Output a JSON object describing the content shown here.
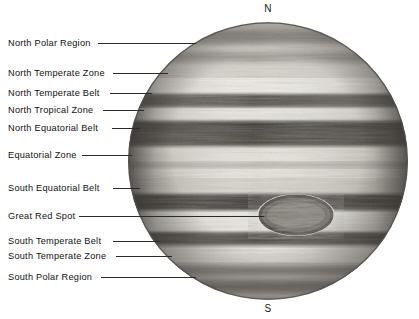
{
  "figure": {
    "background_color": "#ffffff",
    "line_color": "#2b2b2b",
    "text_color": "#111111"
  },
  "poles": {
    "north": "N",
    "south": "S"
  },
  "disc": {
    "center_x": 268,
    "center_y": 161,
    "radius": 140,
    "left": 128,
    "top": 22,
    "width": 280,
    "height": 278
  },
  "labels": [
    {
      "id": "north-polar-region",
      "text": "North Polar Region",
      "text_x": 8,
      "text_y": 38,
      "line_y": 43,
      "line_x1": 98,
      "line_x2": 196
    },
    {
      "id": "north-temperate-zone",
      "text": "North Temperate Zone",
      "text_x": 8,
      "text_y": 68,
      "line_y": 73,
      "line_x1": 113,
      "line_x2": 168
    },
    {
      "id": "north-temperate-belt",
      "text": "North Temperate Belt",
      "text_x": 8,
      "text_y": 88,
      "line_y": 93,
      "line_x1": 110,
      "line_x2": 152
    },
    {
      "id": "north-tropical-zone",
      "text": "North Tropical Zone",
      "text_x": 8,
      "text_y": 105,
      "line_y": 110,
      "line_x1": 103,
      "line_x2": 144
    },
    {
      "id": "north-equatorial-belt",
      "text": "North Equatorial Belt",
      "text_x": 8,
      "text_y": 123,
      "line_y": 128,
      "line_x1": 112,
      "line_x2": 140
    },
    {
      "id": "equatorial-zone",
      "text": "Equatorial Zone",
      "text_x": 8,
      "text_y": 150,
      "line_y": 155,
      "line_x1": 82,
      "line_x2": 132
    },
    {
      "id": "south-equatorial-belt",
      "text": "South Equatorial Belt",
      "text_x": 8,
      "text_y": 183,
      "line_y": 188,
      "line_x1": 113,
      "line_x2": 140
    },
    {
      "id": "great-red-spot",
      "text": "Great Red Spot",
      "text_x": 8,
      "text_y": 211,
      "line_y": 216,
      "line_x1": 79,
      "line_x2": 264
    },
    {
      "id": "south-temperate-belt",
      "text": "South Temperate Belt",
      "text_x": 8,
      "text_y": 236,
      "line_y": 241,
      "line_x1": 113,
      "line_x2": 160
    },
    {
      "id": "south-temperate-zone",
      "text": "South Temperate Zone",
      "text_x": 8,
      "text_y": 251,
      "line_y": 256,
      "line_x1": 116,
      "line_x2": 172
    },
    {
      "id": "south-polar-region",
      "text": "South Polar Region",
      "text_x": 8,
      "text_y": 272,
      "line_y": 277,
      "line_x1": 101,
      "line_x2": 196
    }
  ],
  "features": {
    "great_red_spot": {
      "name": "Great Red Spot",
      "center_x": 296,
      "center_y": 215,
      "width": 74,
      "height": 40
    }
  },
  "bands": [
    {
      "name": "North Polar Region",
      "type": "region",
      "y": 30,
      "height": 36,
      "tone": "#8e8a82"
    },
    {
      "name": "North Temperate Zone",
      "type": "zone",
      "y": 66,
      "height": 14,
      "tone": "#ece9e2"
    },
    {
      "name": "North Temperate Belt",
      "type": "belt",
      "y": 80,
      "height": 13,
      "tone": "#4a4640"
    },
    {
      "name": "North Tropical Zone",
      "type": "zone",
      "y": 93,
      "height": 11,
      "tone": "#e7e4dc"
    },
    {
      "name": "North Equatorial Belt",
      "type": "belt",
      "y": 104,
      "height": 22,
      "tone": "#3e3a35"
    },
    {
      "name": "Equatorial Zone",
      "type": "zone",
      "y": 126,
      "height": 30,
      "tone": "#e3e0d8"
    },
    {
      "name": "South Equatorial Belt",
      "type": "belt",
      "y": 178,
      "height": 14,
      "tone": "#37332e"
    },
    {
      "name": "South Temperate Belt",
      "type": "belt",
      "y": 236,
      "height": 12,
      "tone": "#45413b"
    },
    {
      "name": "South Temperate Zone",
      "type": "zone",
      "y": 248,
      "height": 16,
      "tone": "#eae7e0"
    },
    {
      "name": "South Polar Region",
      "type": "region",
      "y": 264,
      "height": 36,
      "tone": "#8a8680"
    }
  ]
}
